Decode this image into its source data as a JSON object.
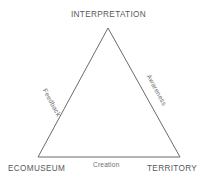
{
  "diagram": {
    "type": "triangle-relationship-diagram",
    "background_color": "#ffffff",
    "stroke_color": "#6b6b6b",
    "stroke_width": 1,
    "vertex_label_color": "#58585a",
    "edge_label_color": "#6e6e70",
    "vertices": [
      {
        "id": "interpretation",
        "label": "INTERPRETATION",
        "position": "top",
        "x": 108,
        "y": 28
      },
      {
        "id": "ecomuseum",
        "label": "ECOMUSEUM",
        "position": "bottom-left",
        "x": 38,
        "y": 157
      },
      {
        "id": "territory",
        "label": "TERRITORY",
        "position": "bottom-right",
        "x": 180,
        "y": 157
      }
    ],
    "edges": [
      {
        "id": "feedback",
        "label": "Feedback",
        "from": "ecomuseum",
        "to": "interpretation",
        "side": "left"
      },
      {
        "id": "awareness",
        "label": "Awareness",
        "from": "interpretation",
        "to": "territory",
        "side": "right"
      },
      {
        "id": "creation",
        "label": "Creation",
        "from": "ecomuseum",
        "to": "territory",
        "side": "bottom"
      }
    ]
  }
}
